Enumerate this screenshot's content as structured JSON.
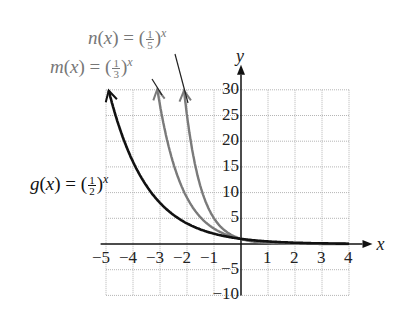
{
  "chart_data": {
    "type": "line",
    "title": "",
    "xlabel": "x",
    "ylabel": "y",
    "xlim": [
      -5,
      4
    ],
    "ylim": [
      -10,
      30
    ],
    "grid": true,
    "x_ticks": [
      "-5",
      "-4",
      "-3",
      "-2",
      "-1",
      "1",
      "2",
      "3",
      "4"
    ],
    "y_ticks": [
      "30",
      "25",
      "20",
      "15",
      "10",
      "5",
      "-5",
      "-10"
    ],
    "series": [
      {
        "name": "g(x) = (1/2)^x",
        "func": "g",
        "base_num": "1",
        "base_den": "2",
        "base": 0.5,
        "color": "#111111",
        "x_start": -4.9
      },
      {
        "name": "m(x) = (1/3)^x",
        "func": "m",
        "base_num": "1",
        "base_den": "3",
        "base": 0.3333,
        "color": "#7a7a7a",
        "x_start": -3.1
      },
      {
        "name": "n(x) = (1/5)^x",
        "func": "n",
        "base_num": "1",
        "base_den": "5",
        "base": 0.2,
        "color": "#7a7a7a",
        "x_start": -2.11
      }
    ],
    "annotations": [
      "n(x) = (1/5)^x",
      "m(x) = (1/3)^x",
      "g(x) = (1/2)^x"
    ]
  },
  "labels": {
    "n": {
      "fn": "n",
      "num": "1",
      "den": "5"
    },
    "m": {
      "fn": "m",
      "num": "1",
      "den": "3"
    },
    "g": {
      "fn": "g",
      "num": "1",
      "den": "2"
    },
    "var": "x",
    "eq": " = ("
  }
}
